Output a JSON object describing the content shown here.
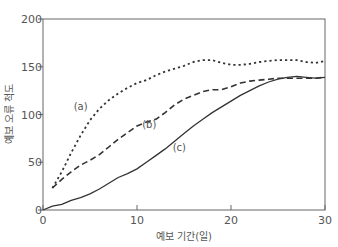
{
  "chart_data": {
    "type": "line",
    "title": "",
    "xlabel": "예보 기간(일)",
    "ylabel": "예보 오류 척도",
    "xlim": [
      0,
      30
    ],
    "ylim": [
      0,
      200
    ],
    "xticks": [
      0,
      10,
      20,
      30
    ],
    "yticks": [
      0,
      50,
      100,
      150,
      200
    ],
    "grid": false,
    "legend": "inline labels",
    "series": [
      {
        "name": "(a)",
        "style": "dotted",
        "x": [
          1,
          2,
          3,
          4,
          5,
          6,
          7,
          8,
          9,
          10,
          11,
          12,
          13,
          14,
          15,
          16,
          17,
          18,
          19,
          20,
          21,
          22,
          23,
          24,
          25,
          26,
          27,
          28,
          29,
          30
        ],
        "values": [
          23,
          40,
          60,
          78,
          94,
          106,
          115,
          122,
          128,
          133,
          136,
          141,
          145,
          148,
          151,
          155,
          157,
          157,
          154,
          152,
          152,
          153,
          155,
          156,
          157,
          157,
          157,
          155,
          154,
          156
        ]
      },
      {
        "name": "(b)",
        "style": "dashed",
        "x": [
          1,
          2,
          3,
          4,
          5,
          6,
          7,
          8,
          9,
          10,
          11,
          12,
          13,
          14,
          15,
          16,
          17,
          18,
          19,
          20,
          21,
          22,
          23,
          24,
          25,
          26,
          27,
          28,
          29,
          30
        ],
        "values": [
          23,
          32,
          40,
          47,
          52,
          58,
          66,
          74,
          81,
          88,
          92,
          95,
          102,
          110,
          116,
          120,
          124,
          126,
          126,
          129,
          133,
          135,
          136,
          137,
          138,
          138,
          138,
          138,
          138,
          139
        ]
      },
      {
        "name": "(c)",
        "style": "solid",
        "x": [
          0,
          1,
          2,
          3,
          4,
          5,
          6,
          7,
          8,
          9,
          10,
          11,
          12,
          13,
          14,
          15,
          16,
          17,
          18,
          19,
          20,
          21,
          22,
          23,
          24,
          25,
          26,
          27,
          28,
          29,
          30
        ],
        "values": [
          0,
          4,
          6,
          10,
          13,
          17,
          22,
          28,
          34,
          38,
          43,
          50,
          57,
          64,
          72,
          80,
          88,
          95,
          102,
          108,
          114,
          120,
          125,
          130,
          134,
          137,
          139,
          140,
          139,
          138,
          139
        ]
      }
    ],
    "labels": [
      {
        "text": "(a)",
        "x": 4.0,
        "y": 105
      },
      {
        "text": "(b)",
        "x": 11.3,
        "y": 86
      },
      {
        "text": "(c)",
        "x": 14.5,
        "y": 62
      }
    ]
  },
  "axes": {
    "x_tick_labels": [
      "0",
      "10",
      "20",
      "30"
    ],
    "y_tick_labels": [
      "0",
      "50",
      "100",
      "150",
      "200"
    ],
    "x_title": "예보 기간(일)",
    "y_title": "예보 오류 척도"
  },
  "colors": {
    "line": "#333333",
    "axis": "#666666",
    "text": "#555555"
  }
}
